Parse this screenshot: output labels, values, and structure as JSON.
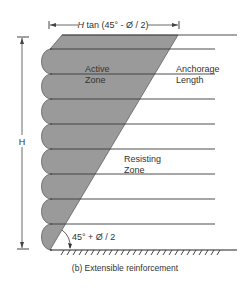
{
  "diagram": {
    "dimension_label": "H tan (45° - Ø / 2)",
    "dimension_label_italic": "H",
    "dimension_label_rest": " tan (45° - Ø / 2)",
    "height_label": "H",
    "active_zone_label": [
      "Active",
      "Zone"
    ],
    "anchorage_label": [
      "Anchorage",
      "Length"
    ],
    "resisting_zone_label": [
      "Resisting",
      "Zone"
    ],
    "angle_label": "45° + Ø / 2",
    "caption": "(b) Extensible reinforcement",
    "layer_count": 9,
    "colors": {
      "active_fill": "#9a9a9a",
      "line": "#3a3a3a",
      "text": "#333333"
    }
  }
}
